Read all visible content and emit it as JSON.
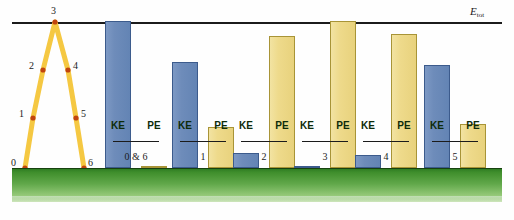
{
  "chart_data": {
    "type": "bar",
    "title": "",
    "xlabel": "",
    "ylabel": "",
    "ylim": [
      0,
      100
    ],
    "grid": false,
    "legend_position": "none",
    "reference_line": {
      "label": "E",
      "sublabel": "tot",
      "value": 100
    },
    "categories": [
      "0 & 6",
      "1",
      "2",
      "3",
      "4",
      "5"
    ],
    "series": [
      {
        "name": "KE",
        "values": [
          100,
          72,
          10,
          1.5,
          9,
          70
        ]
      },
      {
        "name": "PE",
        "values": [
          1.5,
          28,
          90,
          100,
          91,
          30
        ]
      }
    ],
    "bar_labels": {
      "ke": "KE",
      "pe": "PE"
    },
    "colors": {
      "ke_fill": "#6e8cba",
      "ke_border": "#3c5b8c",
      "pe_fill": "#eeda8b",
      "pe_border": "#a89437",
      "ground": "#61a84a",
      "trajectory": "#f5c842",
      "point_marker": "#c1440e",
      "axis_line": "#1b1b1b"
    },
    "trajectory": {
      "description": "projectile path",
      "points": [
        {
          "label": "0",
          "x": 25,
          "y": 168,
          "label_x": 11,
          "label_y": 157
        },
        {
          "label": "1",
          "x": 33,
          "y": 118,
          "label_x": 19,
          "label_y": 108
        },
        {
          "label": "2",
          "x": 43,
          "y": 70,
          "label_x": 29,
          "label_y": 60
        },
        {
          "label": "3",
          "x": 55,
          "y": 22,
          "label_x": 51,
          "label_y": 5
        },
        {
          "label": "4",
          "x": 68,
          "y": 70,
          "label_x": 73,
          "label_y": 60
        },
        {
          "label": "5",
          "x": 76,
          "y": 118,
          "label_x": 81,
          "label_y": 108
        },
        {
          "label": "6",
          "x": 84,
          "y": 168,
          "label_x": 88,
          "label_y": 157
        }
      ]
    },
    "group_positions": [
      105,
      172,
      233,
      294,
      355,
      424
    ]
  }
}
